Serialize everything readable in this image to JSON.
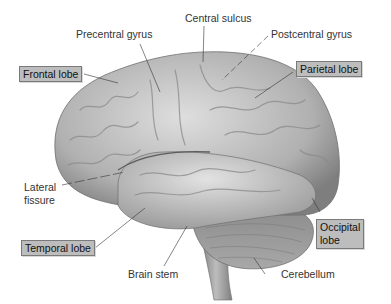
{
  "figure": {
    "colors": {
      "background": "#ffffff",
      "brain": "#bcbcbc",
      "label_box": "#bdbdbd",
      "leader_line": "#333333"
    },
    "labels": [
      {
        "id": "central-sulcus",
        "text": "Central sulcus",
        "boxed": false
      },
      {
        "id": "precentral-gyrus",
        "text": "Precentral gyrus",
        "boxed": false
      },
      {
        "id": "postcentral-gyrus",
        "text": "Postcentral gyrus",
        "boxed": false
      },
      {
        "id": "frontal-lobe",
        "text": "Frontal lobe",
        "boxed": true
      },
      {
        "id": "parietal-lobe",
        "text": "Parietal lobe",
        "boxed": true
      },
      {
        "id": "lateral-fissure",
        "text": "Lateral fissure",
        "line1": "Lateral",
        "line2": "fissure",
        "boxed": false
      },
      {
        "id": "temporal-lobe",
        "text": "Temporal lobe",
        "boxed": true
      },
      {
        "id": "occipital-lobe",
        "text": "Occipital lobe",
        "line1": "Occipital",
        "line2": "lobe",
        "boxed": true
      },
      {
        "id": "brain-stem",
        "text": "Brain stem",
        "boxed": false
      },
      {
        "id": "cerebellum",
        "text": "Cerebellum",
        "boxed": false
      }
    ]
  }
}
